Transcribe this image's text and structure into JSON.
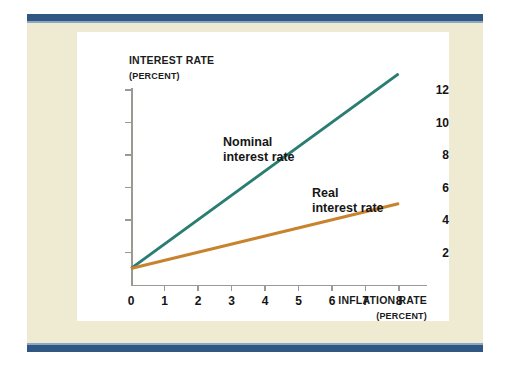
{
  "figure": {
    "background_color": "#eeebd2",
    "card_color": "#ffffff",
    "rule_color": "#2f5784"
  },
  "chart_data": {
    "type": "line",
    "title": "",
    "xlabel": "INFLATION RATE",
    "xlabel_units": "(PERCENT)",
    "ylabel": "INTEREST RATE",
    "ylabel_units": "(PERCENT)",
    "xlim": [
      0,
      8.8
    ],
    "ylim": [
      0,
      13.6
    ],
    "xticks": [
      0,
      1,
      2,
      3,
      4,
      5,
      6,
      7,
      8
    ],
    "xtick_labels": [
      "0",
      "1",
      "2",
      "3",
      "4",
      "5",
      "6",
      "7",
      "8"
    ],
    "yticks": [
      2,
      4,
      6,
      8,
      10,
      12
    ],
    "ytick_labels": [
      "2",
      "4",
      "6",
      "8",
      "10",
      "12"
    ],
    "grid": false,
    "legend_position": "inline-annotation",
    "series": [
      {
        "name": "Nominal interest rate",
        "label_line1": "Nominal",
        "label_line2": "interest rate",
        "color": "#2a7d72",
        "x": [
          0,
          8
        ],
        "values": [
          1,
          13
        ],
        "slope": 1.5,
        "intercept": 1
      },
      {
        "name": "Real interest rate",
        "label_line1": "Real",
        "label_line2": "interest rate",
        "color": "#c8832f",
        "x": [
          0,
          8
        ],
        "values": [
          1,
          5
        ],
        "slope": 0.5,
        "intercept": 1
      }
    ]
  }
}
